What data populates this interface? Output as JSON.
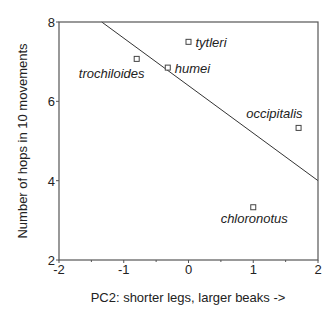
{
  "chart_data": {
    "type": "scatter",
    "title": "",
    "xlabel": "PC2: shorter legs, larger beaks ->",
    "ylabel": "Number of hops in 10 movements",
    "xlim": [
      -2,
      2
    ],
    "ylim": [
      2,
      8
    ],
    "x_ticks": [
      -2,
      -1,
      0,
      1,
      2
    ],
    "x_tick_labels": [
      "-2",
      "-1",
      "0",
      "1",
      "2"
    ],
    "x_minor_ticks": [
      -1.5,
      -0.5,
      0.5,
      1.5
    ],
    "y_ticks": [
      2,
      4,
      6,
      8
    ],
    "y_tick_labels": [
      "2",
      "4",
      "6",
      "8"
    ],
    "grid": false,
    "legend": null,
    "points": [
      {
        "label": "trochiloides",
        "x": -0.8,
        "y": 7.07,
        "label_position": "below-left"
      },
      {
        "label": "tytleri",
        "x": 0.0,
        "y": 7.5,
        "label_position": "right"
      },
      {
        "label": "humei",
        "x": -0.32,
        "y": 6.85,
        "label_position": "right"
      },
      {
        "label": "occipitalis",
        "x": 1.7,
        "y": 5.33,
        "label_position": "above-left"
      },
      {
        "label": "chloronotus",
        "x": 1.0,
        "y": 3.33,
        "label_position": "below"
      }
    ],
    "fit_line": {
      "type": "linear",
      "from": {
        "x": -1.34,
        "y": 8.0
      },
      "to": {
        "x": 2.0,
        "y": 4.0
      }
    }
  }
}
